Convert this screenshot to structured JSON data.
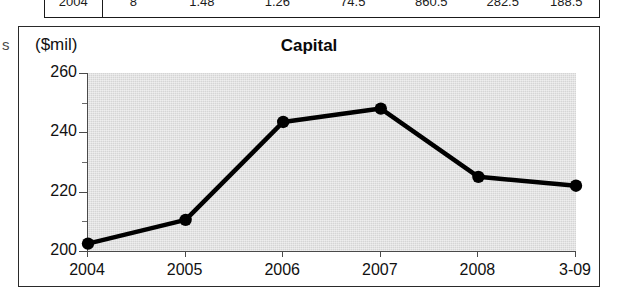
{
  "table_strip": {
    "name": "cut-off-table-row",
    "cells": [
      "2004",
      "8",
      "1.48",
      "1.26",
      "74.5",
      "860.5",
      "282.5",
      "188.5",
      "11.5"
    ]
  },
  "margin_glyph": "s",
  "chart": {
    "unit_label": "($mil)",
    "title": "Capital"
  },
  "chart_data": {
    "type": "line",
    "title": "Capital",
    "subtitle": "",
    "xlabel": "",
    "ylabel": "($mil)",
    "unit": "$mil",
    "categories": [
      "2004",
      "2005",
      "2006",
      "2007",
      "2008",
      "3-09"
    ],
    "values": [
      202.5,
      210.5,
      243.5,
      248.0,
      225.0,
      222.0
    ],
    "series": [
      {
        "name": "Capital",
        "values": [
          202.5,
          210.5,
          243.5,
          248.0,
          225.0,
          222.0
        ]
      }
    ],
    "ylim": [
      200,
      260
    ],
    "yticks": [
      200,
      220,
      240,
      260
    ],
    "ytick_labels": [
      "200",
      "220",
      "240",
      "260"
    ],
    "yminor_ticks": [
      210,
      230,
      250
    ],
    "grid": false,
    "legend": false,
    "marker": "filled-circle",
    "line_color": "#000000",
    "plot_background": "#dcdcdc"
  }
}
